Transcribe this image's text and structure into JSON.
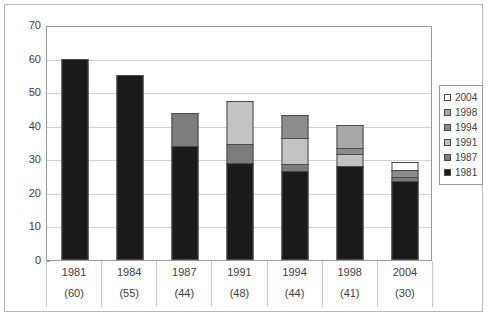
{
  "chart_data": {
    "type": "bar",
    "stacked": true,
    "title": "",
    "xlabel": "",
    "ylabel": "",
    "ylim": [
      0,
      70
    ],
    "yticks": [
      0,
      10,
      20,
      30,
      40,
      50,
      60,
      70
    ],
    "grid": true,
    "legend_position": "right",
    "categories": [
      "1981",
      "1984",
      "1987",
      "1991",
      "1994",
      "1998",
      "2004"
    ],
    "category_counts": [
      "(60)",
      "(55)",
      "(44)",
      "(48)",
      "(44)",
      "(41)",
      "(30)"
    ],
    "totals": [
      60,
      55,
      44,
      48,
      44,
      41,
      30
    ],
    "series": [
      {
        "name": "1981",
        "color": "#1a1a1a",
        "values": [
          60,
          55,
          34,
          29,
          26.5,
          28,
          23.5
        ]
      },
      {
        "name": "1987",
        "color": "#7d7d7d",
        "values": [
          0,
          0,
          10,
          6,
          2.5,
          0,
          1.5
        ]
      },
      {
        "name": "1991",
        "color": "#c2c2c2",
        "values": [
          0,
          0,
          0,
          13,
          8,
          4,
          0
        ]
      },
      {
        "name": "1994",
        "color": "#8c8c8c",
        "values": [
          0,
          0,
          0,
          0,
          7,
          2,
          2.5
        ]
      },
      {
        "name": "1998",
        "color": "#a8a8a8",
        "values": [
          0,
          0,
          0,
          0,
          0,
          7,
          0
        ]
      },
      {
        "name": "2004",
        "color": "#ffffff",
        "values": [
          0,
          0,
          0,
          0,
          0,
          0,
          2.5
        ]
      }
    ]
  },
  "legend": {
    "items": [
      {
        "label": "2004",
        "color": "#ffffff"
      },
      {
        "label": "1998",
        "color": "#a8a8a8"
      },
      {
        "label": "1994",
        "color": "#8c8c8c"
      },
      {
        "label": "1991",
        "color": "#c2c2c2"
      },
      {
        "label": "1987",
        "color": "#7d7d7d"
      },
      {
        "label": "1981",
        "color": "#1a1a1a"
      }
    ]
  }
}
